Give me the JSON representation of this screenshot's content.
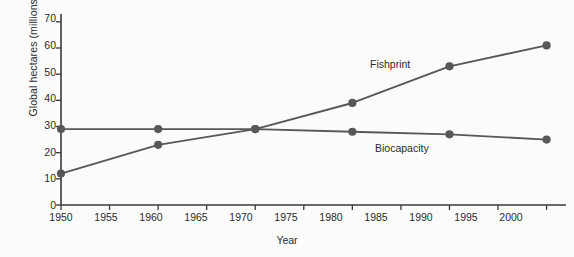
{
  "chart_data": {
    "type": "line",
    "title": "",
    "subtitle": "",
    "xlabel": "Year",
    "ylabel": "Global hectares (millions)",
    "x": [
      1950,
      1960,
      1970,
      1980,
      1990,
      2000
    ],
    "xlim": [
      1950,
      2002
    ],
    "ylim": [
      0,
      73
    ],
    "xticks": [
      "1950",
      "1955",
      "1960",
      "1965",
      "1970",
      "1975",
      "1980",
      "1985",
      "1990",
      "1995",
      "2000"
    ],
    "xtick_values": [
      1950,
      1955,
      1960,
      1965,
      1970,
      1975,
      1980,
      1985,
      1990,
      1995,
      2000
    ],
    "yticks": [
      "0",
      "10",
      "20",
      "30",
      "40",
      "50",
      "60",
      "70"
    ],
    "ytick_values": [
      0,
      10,
      20,
      30,
      40,
      50,
      60,
      70
    ],
    "grid": false,
    "legend_position": "inline-annotations",
    "markers": "filled-circle",
    "series": [
      {
        "name": "Fishprint",
        "values": [
          12,
          23,
          29,
          39,
          53,
          61
        ],
        "color": "#585858",
        "label_x": 1983,
        "label_y": 47
      },
      {
        "name": "Biocapacity",
        "values": [
          29,
          29,
          29,
          28,
          27,
          25
        ],
        "color": "#585858",
        "label_x": 1984,
        "label_y": 21
      }
    ],
    "annotations": [
      {
        "text": "Fishprint"
      },
      {
        "text": "Biocapacity"
      }
    ],
    "axis_color": "#3a3a3a",
    "background_color": "#fbfbfb"
  }
}
